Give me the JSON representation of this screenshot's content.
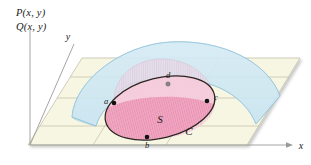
{
  "figure": {
    "background_color": "#ffffff"
  },
  "labels": {
    "function_p": "P(x, y)",
    "function_q": "Q(x, y)",
    "axis_y": "y",
    "axis_x": "x",
    "point_a": "a",
    "point_b": "b",
    "point_c": "c",
    "point_d": "d",
    "region_s": "S",
    "curve_c": "C"
  },
  "colors": {
    "plane_fill": "#f7f6e2",
    "plane_stroke": "#b9b69a",
    "surface_blue_fill": "#cfe7f2",
    "surface_blue_stroke": "#8fc2d8",
    "region_pink_fill": "#f3a9c4",
    "region_pink_stroke": "#3a2a2a",
    "cylinder_pink_fill": "#f2c9d9",
    "cylinder_pink_stroke": "#d79bb6",
    "axis_stroke": "#9a9a9a",
    "point_fill": "#111111",
    "text": "#1a1a1a"
  },
  "geometry": {
    "points": [
      {
        "name": "a",
        "x": 114,
        "y": 103,
        "label_dx": -8,
        "label_dy": 0
      },
      {
        "name": "b",
        "x": 147,
        "y": 137,
        "label_dx": 0,
        "label_dy": 10
      },
      {
        "name": "c",
        "x": 207,
        "y": 101,
        "label_dx": 9,
        "label_dy": -2
      },
      {
        "name": "d",
        "x": 168,
        "y": 79,
        "label_dx": 1,
        "label_dy": -6
      }
    ],
    "ellipse": {
      "cx": 160,
      "cy": 108,
      "rx": 56,
      "ry": 30,
      "rotation": -14
    },
    "region_label_pos": {
      "x": 160,
      "y": 122
    },
    "curve_label_pos": {
      "x": 189,
      "y": 134
    },
    "axis_x_label_pos": {
      "x": 299,
      "y": 149
    },
    "axis_y_label_pos": {
      "x": 69,
      "y": 37
    },
    "function_label_pos": {
      "x": 16,
      "y": 15
    }
  }
}
